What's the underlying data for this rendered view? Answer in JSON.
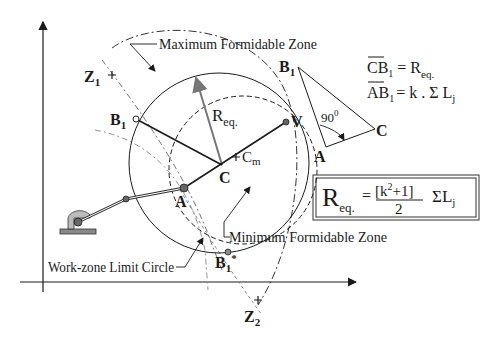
{
  "diagram": {
    "labels": {
      "max_zone": "Maximum Formidable Zone",
      "min_zone": "Minimum Formidable Zone",
      "work_zone": "Work-zone Limit Circle",
      "z1": "Z",
      "z1_sub": "1",
      "z2": "Z",
      "z2_sub": "2",
      "b1": "B",
      "b1_sub": "1",
      "b1_star": "B",
      "b1_star_sub": "1",
      "b1_star_sup": "*",
      "r_eq": "R",
      "r_eq_sub": "eq.",
      "v": "V",
      "c": "C",
      "cm": "C",
      "cm_sub": "m",
      "a": "A"
    },
    "triangle": {
      "b1": "B",
      "b1_sub": "1",
      "a": "A",
      "c": "C",
      "angle": "90",
      "angle_sup": "0"
    },
    "equations": {
      "line1_lhs": "CB",
      "line1_lhs_sub": "1",
      "line1_rhs": "= R",
      "line1_rhs_sub": "eq.",
      "line2_lhs": "AB",
      "line2_lhs_sub": "1",
      "line2_rhs": "= k . Σ L",
      "line2_rhs_sub": "j"
    },
    "boxed_formula": {
      "lhs": "R",
      "lhs_sub": "eq.",
      "equals": "=",
      "numerator": "[k",
      "numerator_sup": "2",
      "numerator_end": "+1]",
      "denominator": "2",
      "sum": "ΣL",
      "sum_sub": "j"
    },
    "colors": {
      "ink": "#1a1a1a",
      "radius_arrow": "#777777",
      "point_fill": "#666666"
    }
  }
}
